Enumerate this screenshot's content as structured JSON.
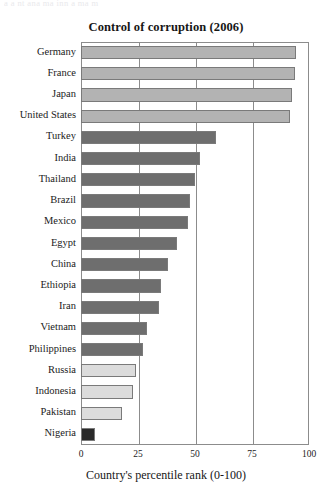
{
  "page": {
    "top_clipped_text": "a  a   nt   ana   ma  inn a   ma   m",
    "background_color": "#ffffff"
  },
  "chart_data": {
    "type": "bar",
    "orientation": "horizontal",
    "title": "Control of corruption (2006)",
    "xlabel": "Country's percentile rank (0-100)",
    "ylabel": "",
    "xlim": [
      0,
      100
    ],
    "xticks": [
      0,
      25,
      50,
      75,
      100
    ],
    "xtick_labels": [
      "0",
      "25",
      "50",
      "75",
      "100"
    ],
    "grid": true,
    "grid_axis": "x",
    "legend": false,
    "categories": [
      "Germany",
      "France",
      "Japan",
      "United States",
      "Turkey",
      "India",
      "Thailand",
      "Brazil",
      "Mexico",
      "Egypt",
      "China",
      "Ethiopia",
      "Iran",
      "Vietnam",
      "Philippines",
      "Russia",
      "Indonesia",
      "Pakistan",
      "Nigeria"
    ],
    "values": [
      94.5,
      94,
      92.5,
      91.5,
      59,
      52,
      50,
      48,
      47,
      42,
      38,
      35,
      34,
      29,
      27,
      24,
      23,
      18,
      6
    ],
    "bar_colors": [
      "#b3b3b3",
      "#b3b3b3",
      "#b3b3b3",
      "#b3b3b3",
      "#6e6e6e",
      "#6e6e6e",
      "#6e6e6e",
      "#6e6e6e",
      "#6e6e6e",
      "#6e6e6e",
      "#6e6e6e",
      "#6e6e6e",
      "#6e6e6e",
      "#6e6e6e",
      "#6e6e6e",
      "#dcdcdc",
      "#dcdcdc",
      "#dcdcdc",
      "#2a2a2a"
    ],
    "bar_edge_color": "#7a7a7a",
    "axis_color": "#8c8c8c",
    "text_color": "#1b1b1b"
  }
}
